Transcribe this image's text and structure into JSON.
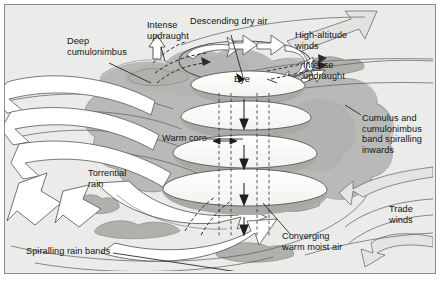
{
  "diagram": {
    "type": "annotated-cutaway-diagram",
    "frame": {
      "background_color": "#ebebe9",
      "border_color": "#8d8d8d",
      "cloud_fill_color": "#b9b9b7",
      "cloud_dark_color": "#a7a7a4",
      "arrow_fill_color": "#ffffff",
      "arrow_stroke_color": "#555555",
      "text_color": "#131313"
    },
    "labels": [
      {
        "id": "deep-cumulonimbus",
        "text": "Deep\ncumulonimbus",
        "x": 62,
        "y": 33,
        "align": "left",
        "leader": true
      },
      {
        "id": "intense-updraught-left",
        "text": "Intense\nupdraught",
        "x": 142,
        "y": 17,
        "align": "left",
        "leader": true
      },
      {
        "id": "descending-dry-air",
        "text": "Descending dry air",
        "x": 186,
        "y": 13,
        "align": "left",
        "leader": true
      },
      {
        "id": "high-altitude-winds",
        "text": "High-altitude\nwinds",
        "x": 290,
        "y": 27,
        "align": "left",
        "leader": false
      },
      {
        "id": "intense-updraught-right",
        "text": "Intense\nupdraught",
        "x": 298,
        "y": 57,
        "align": "left",
        "leader": true
      },
      {
        "id": "eye",
        "text": "Eye",
        "x": 228,
        "y": 71,
        "align": "left",
        "leader": true
      },
      {
        "id": "cumulus-band",
        "text": "Cumulus and\ncumulonimbus\nband spiralling\ninwards",
        "x": 357,
        "y": 110,
        "align": "left",
        "leader": true
      },
      {
        "id": "warm-core",
        "text": "Warm core",
        "x": 157,
        "y": 130,
        "align": "left",
        "leader": true
      },
      {
        "id": "torrential-rain",
        "text": "Torrential\nrain",
        "x": 83,
        "y": 165,
        "align": "left",
        "leader": false
      },
      {
        "id": "trade-winds",
        "text": "Trade\nwinds",
        "x": 384,
        "y": 201,
        "align": "left",
        "leader": false
      },
      {
        "id": "spiralling-rain-bands",
        "text": "Spiralling rain bands",
        "x": 21,
        "y": 243,
        "align": "left",
        "leader": true
      },
      {
        "id": "converging-warm-moist-air",
        "text": "Converging\nwarm moist air",
        "x": 277,
        "y": 228,
        "align": "left",
        "leader": true
      }
    ],
    "features": [
      {
        "id": "eye-wall-helix",
        "name": "spiralling eyewall bands",
        "count": 4
      },
      {
        "id": "outflow-ring",
        "name": "high-level outflow ring with arrow prongs",
        "prongs": 5
      },
      {
        "id": "inflow-arrows",
        "name": "low-level spiralling inflow arrows",
        "count": 4
      },
      {
        "id": "descending-arrows",
        "name": "descending dry air arrows in eye",
        "count": 3
      }
    ]
  }
}
